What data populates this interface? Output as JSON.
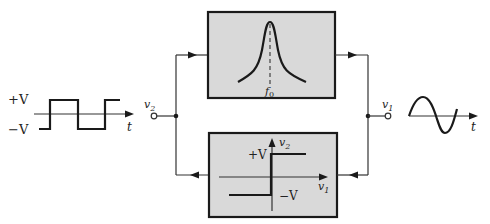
{
  "diagram": {
    "type": "block-diagram",
    "input_waveform": {
      "kind": "square-wave",
      "high_label": "+V",
      "low_label": "−V",
      "time_label": "t"
    },
    "nodes": {
      "left_terminal": {
        "label_base": "v",
        "label_sub": "2"
      },
      "right_terminal": {
        "label_base": "v",
        "label_sub": "1"
      }
    },
    "top_block": {
      "name": "bandpass-filter",
      "curve": "resonance-peak",
      "center_label_base": "f",
      "center_label_sub": "0"
    },
    "bottom_block": {
      "name": "limiter-comparator",
      "y_axis_base": "v",
      "y_axis_sub": "2",
      "x_axis_base": "v",
      "x_axis_sub": "1",
      "high_label": "+V",
      "low_label": "−V"
    },
    "output_waveform": {
      "kind": "sine-wave",
      "time_label": "t"
    },
    "colors": {
      "block_fill": "#d9d9d9",
      "stroke": "#1a1a1a",
      "background": "#ffffff"
    }
  }
}
